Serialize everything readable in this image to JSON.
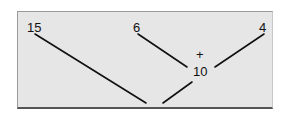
{
  "diagram": {
    "numbers": {
      "a": "15",
      "b": "6",
      "c": "4",
      "sum": "10"
    },
    "operator": "+"
  }
}
